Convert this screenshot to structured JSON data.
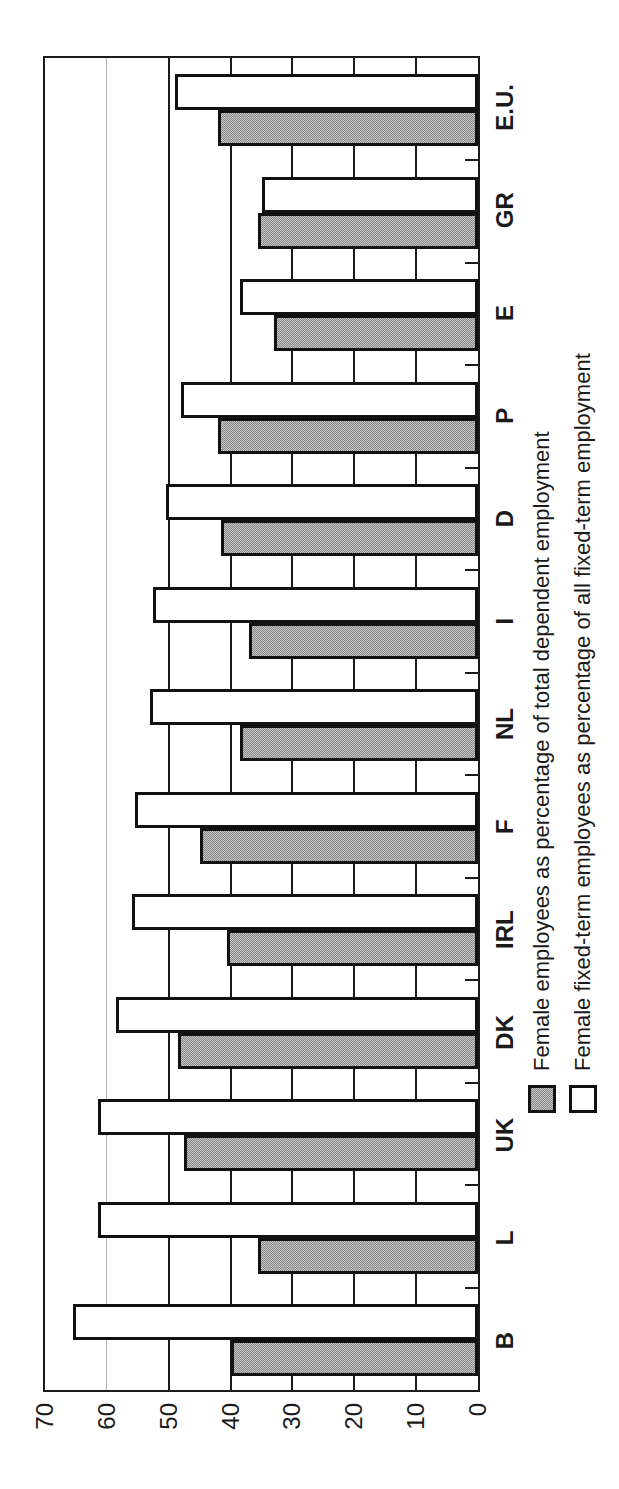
{
  "chart_data": {
    "type": "bar",
    "title": "",
    "xlabel": "",
    "ylabel": "",
    "categories": [
      "B",
      "L",
      "UK",
      "DK",
      "IRL",
      "F",
      "NL",
      "I",
      "D",
      "P",
      "E",
      "GR",
      "E.U."
    ],
    "series": [
      {
        "name": "Female employees as percentage of total dependent employment",
        "swatch": "gray-dotted",
        "values": [
          40,
          35.5,
          47.5,
          48.5,
          40.5,
          45,
          38.5,
          37,
          41.5,
          42,
          33,
          35.5,
          42
        ]
      },
      {
        "name": "Female fixed-term employees as percentage of all fixed-term employment",
        "swatch": "white",
        "values": [
          65.5,
          61.5,
          61.5,
          58.5,
          56,
          55.5,
          53,
          52.5,
          50.5,
          48,
          38.5,
          35,
          49
        ]
      }
    ],
    "ylim": [
      0,
      70
    ],
    "yticks": [
      0,
      10,
      20,
      30,
      40,
      50,
      60,
      70
    ],
    "ytick_labels": [
      "0",
      "10",
      "20",
      "30",
      "40",
      "50",
      "60",
      "70"
    ],
    "grid": "horizontal gridlines every 10 units; 60-line light gray, others thin black",
    "legend_position": "below category axis labels",
    "page_orientation": "chart rotated 90 degrees counter-clockwise on portrait page",
    "bar_order_in_group": [
      "gray-dotted",
      "white"
    ]
  },
  "legend": {
    "items": [
      {
        "label": "Female employees as percentage of total dependent employment",
        "swatch": "gray-dotted"
      },
      {
        "label": "Female fixed-term employees as percentage of all fixed-term employment",
        "swatch": "white"
      }
    ]
  },
  "colors": {
    "background": "#ffffff",
    "axis_and_text": "#1a1a1a",
    "bar_border": "#111111",
    "gray_bar_dark_dot": "#878787",
    "gray_bar_light_dot": "#c6c6c6",
    "light_gridline": "#b5b5b5",
    "white_bar_fill": "#ffffff"
  }
}
